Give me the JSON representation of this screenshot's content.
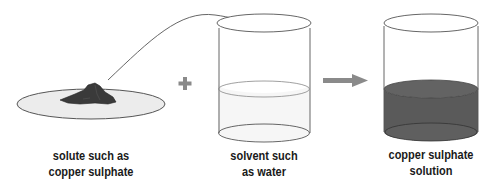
{
  "diagram": {
    "labels": {
      "solute": {
        "line1": "solute such as",
        "line2": "copper sulphate"
      },
      "solvent": {
        "line1": "solvent such",
        "line2": "as water"
      },
      "solution": {
        "line1": "copper sulphate",
        "line2": "solution"
      }
    },
    "operators": {
      "plus": "plus-sign",
      "arrow": "right-arrow"
    },
    "colors": {
      "solute": "#3a3a3a",
      "dish": "#ececec",
      "water": "#f4f4f4",
      "solution": "#5a5a5a",
      "operator": "#8a8a8a",
      "outline": "#555555"
    }
  }
}
